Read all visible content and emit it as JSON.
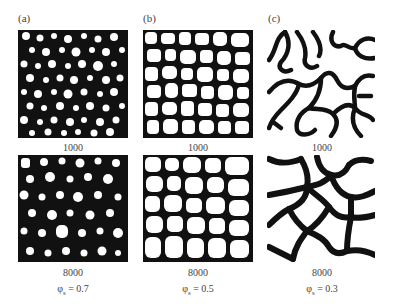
{
  "figure": {
    "columns": [
      {
        "tag": "(a)",
        "top_label": "1000",
        "bottom_label": "8000",
        "phi_symbol": "φ",
        "phi_sub": "s",
        "phi_value": "= 0.7"
      },
      {
        "tag": "(b)",
        "top_label": "1000",
        "bottom_label": "8000",
        "phi_symbol": "φ",
        "phi_sub": "s",
        "phi_value": "= 0.5"
      },
      {
        "tag": "(c)",
        "top_label": "1000",
        "bottom_label": "8000",
        "phi_symbol": "φ",
        "phi_sub": "s",
        "phi_value": "= 0.3"
      }
    ],
    "colors": {
      "matrix": "#111111",
      "domain": "#ffffff",
      "text": "#444444"
    }
  }
}
